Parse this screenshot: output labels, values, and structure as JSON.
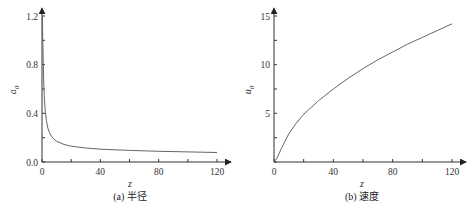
{
  "chart_data": [
    {
      "type": "line",
      "panel": "a",
      "caption": "(a) 半径",
      "title": "",
      "xlabel": "z",
      "ylabel": "a",
      "ylabel_sub": "0",
      "xlim": [
        0,
        120
      ],
      "ylim": [
        0,
        1.2
      ],
      "xticks": [
        "0",
        "40",
        "80",
        "120"
      ],
      "yticks": [
        "0.0",
        "0.4",
        "0.8",
        "1.2"
      ],
      "grid": false,
      "legend": null,
      "series": [
        {
          "name": "a0",
          "x": [
            0.3,
            0.6,
            1,
            1.5,
            2,
            3,
            4,
            5,
            6,
            8,
            10,
            15,
            20,
            30,
            40,
            60,
            80,
            100,
            120
          ],
          "values": [
            1.2,
            0.95,
            0.72,
            0.55,
            0.45,
            0.34,
            0.28,
            0.245,
            0.22,
            0.19,
            0.17,
            0.145,
            0.13,
            0.115,
            0.105,
            0.095,
            0.088,
            0.083,
            0.078
          ]
        }
      ]
    },
    {
      "type": "line",
      "panel": "b",
      "caption": "(b) 速度",
      "title": "",
      "xlabel": "z",
      "ylabel": "u",
      "ylabel_sub": "0",
      "xlim": [
        0,
        120
      ],
      "ylim": [
        0,
        15
      ],
      "xticks": [
        "0",
        "40",
        "80",
        "120"
      ],
      "yticks": [
        "5",
        "10",
        "15"
      ],
      "y_origin_label": "0",
      "grid": false,
      "legend": null,
      "series": [
        {
          "name": "u0",
          "x": [
            0,
            2,
            5,
            10,
            15,
            20,
            30,
            40,
            50,
            60,
            70,
            80,
            90,
            100,
            110,
            120
          ],
          "values": [
            0,
            0.4,
            1.4,
            2.9,
            4.0,
            4.9,
            6.3,
            7.5,
            8.6,
            9.6,
            10.5,
            11.3,
            12.1,
            12.8,
            13.5,
            14.2
          ]
        }
      ]
    }
  ],
  "style": {
    "axis_color": "#333333",
    "curve_color": "#555555"
  }
}
